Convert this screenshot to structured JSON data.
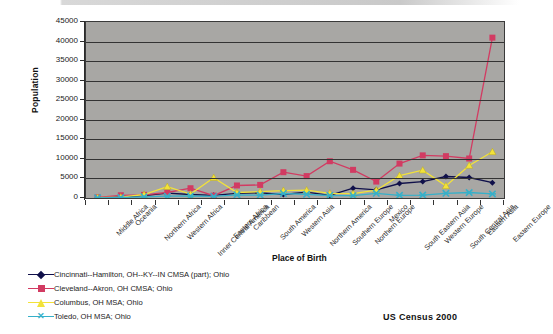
{
  "chart_data": {
    "type": "line",
    "title": "",
    "xlabel": "Place of Birth",
    "ylabel": "Population",
    "ylim": [
      0,
      45000
    ],
    "ytick_labels": [
      "45000",
      "40000",
      "35000",
      "30000",
      "25000",
      "20000",
      "15000",
      "10000",
      "5000",
      "0"
    ],
    "ytick_values": [
      45000,
      40000,
      35000,
      30000,
      25000,
      20000,
      15000,
      10000,
      5000,
      0
    ],
    "grid": true,
    "legend_position": "bottom-left",
    "source_note": "US Census 2000",
    "categories": [
      "Middle Africa",
      "Oceania",
      "Northern Africa",
      "Western Africa",
      "Inner Central America",
      "Eastern Africa",
      "Caribbean",
      "South America",
      "Western Asia",
      "Northern America",
      "Southern Europe",
      "Northern Europe",
      "Mexico",
      "South Eastern Asia",
      "Western Europe",
      "South Central Asia",
      "Eastern Asia",
      "Eastern Europe"
    ],
    "series": [
      {
        "name": "Cincinnati--Hamilton, OH--KY--IN CMSA (part); Ohio",
        "color": "#10104a",
        "marker": "diamond",
        "values": [
          60,
          250,
          600,
          1250,
          900,
          700,
          1200,
          1300,
          900,
          1500,
          700,
          2500,
          2100,
          3700,
          4200,
          5500,
          5250,
          3900
        ]
      },
      {
        "name": "Cleveland--Akron, OH CMSA; Ohio",
        "color": "#d23b62",
        "marker": "square",
        "values": [
          150,
          700,
          800,
          1400,
          2500,
          600,
          3200,
          3350,
          6600,
          5600,
          9400,
          7200,
          4200,
          8800,
          10900,
          10700,
          10100,
          41000
        ]
      },
      {
        "name": "Columbus, OH MSA; Ohio",
        "color": "#f2e23a",
        "marker": "triangle",
        "values": [
          80,
          200,
          900,
          2900,
          1000,
          5200,
          1400,
          1600,
          1900,
          2000,
          1200,
          1100,
          2000,
          5700,
          7100,
          3100,
          8300,
          11800
        ]
      },
      {
        "name": "Toledo, OH MSA; Ohio",
        "color": "#36b0c9",
        "marker": "x",
        "values": [
          40,
          120,
          300,
          450,
          500,
          400,
          800,
          750,
          1150,
          950,
          650,
          600,
          1200,
          700,
          750,
          1200,
          1400,
          1050
        ]
      }
    ],
    "series_last_columbus_dip": 5300
  },
  "legend": {
    "items": [
      {
        "label": "Cincinnati--Hamilton, OH--KY--IN CMSA (part); Ohio"
      },
      {
        "label": "Cleveland--Akron, OH CMSA; Ohio"
      },
      {
        "label": "Columbus, OH MSA; Ohio"
      },
      {
        "label": "Toledo, OH MSA; Ohio"
      }
    ]
  },
  "axis": {
    "y_title": "Population",
    "x_title": "Place of Birth"
  },
  "footer": {
    "source": "US Census 2000"
  }
}
